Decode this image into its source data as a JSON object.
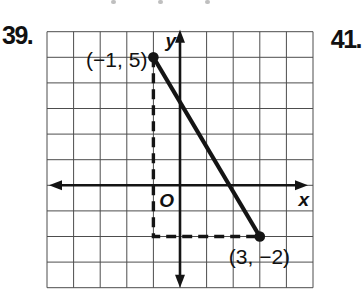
{
  "page": {
    "background": "#ffffff"
  },
  "problems": {
    "left_number": "39.",
    "right_number": "41."
  },
  "colors": {
    "ink": "#141414",
    "grid_line": "#4d4d4d",
    "artifact": "#8a8a8a"
  },
  "chart_data": {
    "type": "line",
    "title": "",
    "x_range": [
      -5,
      5
    ],
    "y_range": [
      -4,
      6
    ],
    "grid": true,
    "points": [
      {
        "x": -1,
        "y": 5,
        "label": "(−1, 5)"
      },
      {
        "x": 3,
        "y": -2,
        "label": "(3, −2)"
      }
    ],
    "segment": [
      [
        -1,
        5
      ],
      [
        3,
        -2
      ]
    ],
    "dashed_path": [
      [
        -1,
        5
      ],
      [
        -1,
        -2
      ],
      [
        3,
        -2
      ]
    ],
    "axis_labels": {
      "x": "x",
      "y": "y",
      "origin": "O"
    }
  },
  "artifacts": {
    "top_marks_x": [
      111,
      158,
      205
    ]
  }
}
